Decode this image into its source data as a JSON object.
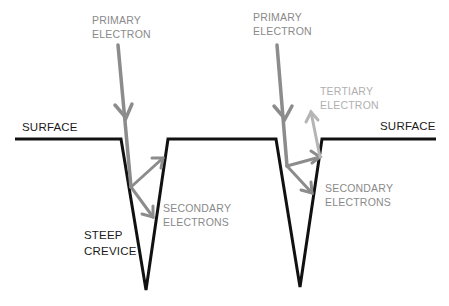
{
  "labels": {
    "primary_left": [
      "PRIMARY",
      "ELECTRON"
    ],
    "primary_right": [
      "PRIMARY",
      "ELECTRON"
    ],
    "tertiary": [
      "TERTIARY",
      "ELECTRON"
    ],
    "surface_left": "SURFACE",
    "surface_right": "SURFACE",
    "secondary_left": [
      "SECONDARY",
      "ELECTRONS"
    ],
    "secondary_right": [
      "SECONDARY",
      "ELECTRONS"
    ],
    "crevice": [
      "STEEP",
      "CREVICE"
    ]
  },
  "colors": {
    "surface": "#111111",
    "primary_arrow": "#8c8c8c",
    "secondary_arrow": "#8c8c8c",
    "tertiary_arrow": "#b5b5b5"
  }
}
